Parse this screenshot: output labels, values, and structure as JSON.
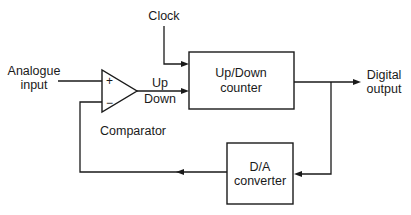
{
  "diagram": {
    "blocks": {
      "comparator": {
        "label": "Comparator",
        "plus": "+",
        "minus": "−"
      },
      "counter": {
        "line1": "Up/Down",
        "line2": "counter"
      },
      "dac": {
        "line1": "D/A",
        "line2": "converter"
      }
    },
    "signals": {
      "analogue_input": {
        "line1": "Analogue",
        "line2": "input"
      },
      "clock": "Clock",
      "up": "Up",
      "down": "Down",
      "digital_output": {
        "line1": "Digital",
        "line2": "output"
      }
    },
    "colors": {
      "stroke": "#1a1a1a",
      "background": "#ffffff"
    }
  }
}
